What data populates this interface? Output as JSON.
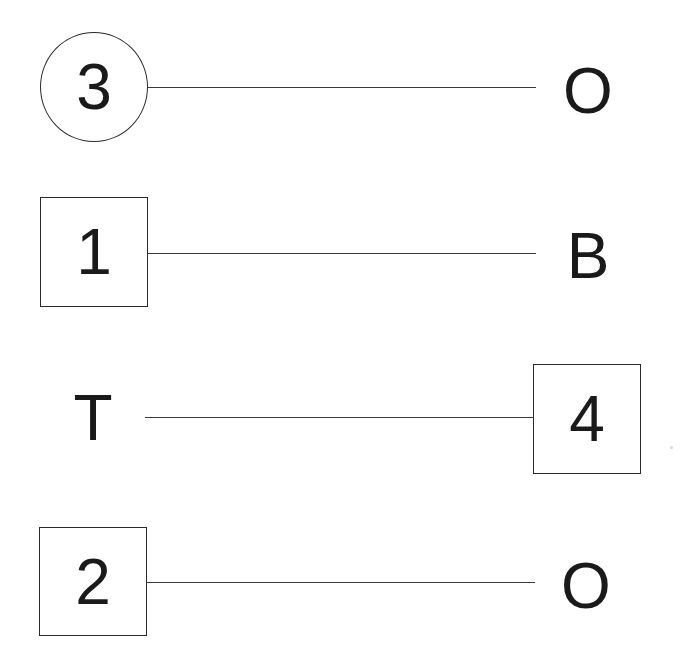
{
  "diagram": {
    "type": "matching-connections",
    "rows": [
      {
        "left": {
          "label": "3",
          "shape": "circle"
        },
        "right": {
          "label": "O",
          "shape": "none"
        }
      },
      {
        "left": {
          "label": "1",
          "shape": "square"
        },
        "right": {
          "label": "B",
          "shape": "none"
        }
      },
      {
        "left": {
          "label": "T",
          "shape": "none"
        },
        "right": {
          "label": "4",
          "shape": "square"
        }
      },
      {
        "left": {
          "label": "2",
          "shape": "square"
        },
        "right": {
          "label": "O",
          "shape": "none"
        }
      }
    ],
    "colors": {
      "stroke": "#2a2a2a",
      "text": "#1a1a1a",
      "background": "#ffffff"
    }
  }
}
